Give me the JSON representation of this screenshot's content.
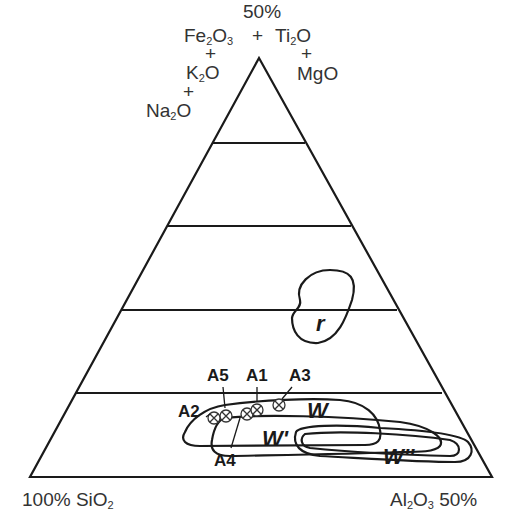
{
  "diagram": {
    "type": "ternary",
    "apex_top": {
      "percent": "50%",
      "line1_a": "Fe",
      "line1_a_sub": "2",
      "line1_b": "O",
      "line1_b_sub": "3",
      "plus": "+",
      "line1_c": "Ti",
      "line1_c_sub": "2",
      "line1_d": "O",
      "k_a": "K",
      "k_sub": "2",
      "k_b": "O",
      "na_a": "Na",
      "na_sub": "2",
      "na_b": "O",
      "mgo": "MgO"
    },
    "bottom_left": {
      "percent": "100%",
      "a": "SiO",
      "sub": "2"
    },
    "bottom_right": {
      "a": "Al",
      "a_sub": "2",
      "b": "O",
      "b_sub": "3",
      "percent": "50%"
    },
    "fields": [
      "r",
      "W",
      "W'",
      "W''"
    ],
    "points": [
      "A1",
      "A2",
      "A3",
      "A4",
      "A5"
    ]
  }
}
